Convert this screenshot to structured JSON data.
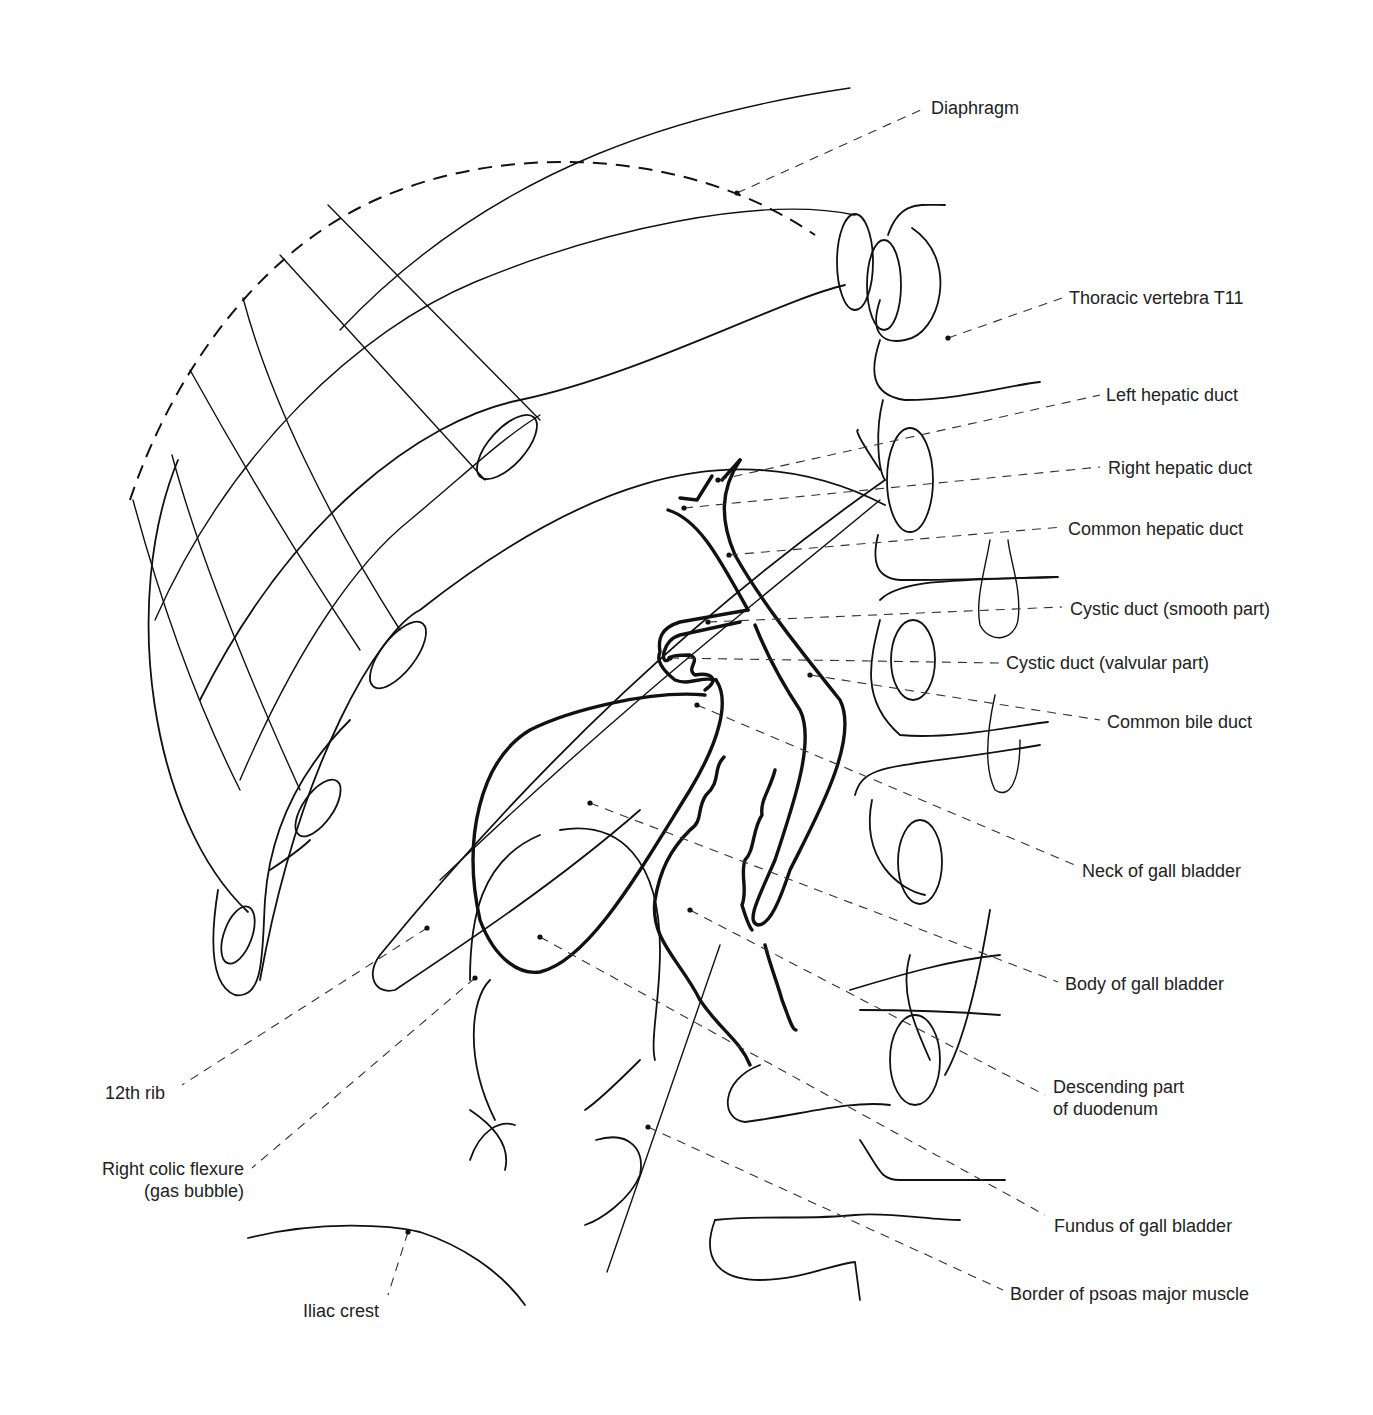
{
  "figure": {
    "type": "anatomical-line-drawing"
  },
  "labels": {
    "diaphragm": "Diaphragm",
    "thoracic_vertebra_t11": "Thoracic vertebra T11",
    "left_hepatic_duct": "Left hepatic duct",
    "right_hepatic_duct": "Right hepatic duct",
    "common_hepatic_duct": "Common hepatic duct",
    "cystic_duct_smooth": "Cystic duct (smooth part)",
    "cystic_duct_valvular": "Cystic duct (valvular part)",
    "common_bile_duct": "Common bile duct",
    "neck_of_gall_bladder": "Neck of gall bladder",
    "body_of_gall_bladder": "Body of gall bladder",
    "descending_duodenum_line1": "Descending part",
    "descending_duodenum_line2": "of duodenum",
    "fundus_of_gall_bladder": "Fundus of gall bladder",
    "border_psoas": "Border of psoas major muscle",
    "twelfth_rib": "12th rib",
    "right_colic_flexure_line1": "Right colic flexure",
    "right_colic_flexure_line2": "(gas bubble)",
    "iliac_crest": "Iliac crest"
  },
  "colors": {
    "line": "#111111",
    "leader": "#333333",
    "text": "#222222",
    "background": "#ffffff"
  }
}
